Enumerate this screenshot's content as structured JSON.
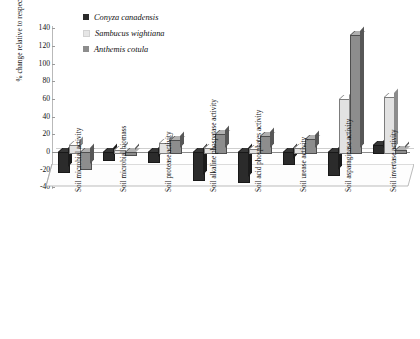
{
  "chart_data": {
    "type": "bar",
    "title": "",
    "xlabel": "",
    "ylabel": "% change relative to respective controls",
    "ylim": [
      -40,
      140
    ],
    "yticks": [
      140,
      120,
      100,
      80,
      60,
      40,
      20,
      0,
      -20,
      -40
    ],
    "grid": false,
    "legend_position": "top-left",
    "categories": [
      "Soil microbial activity",
      "Soil microbial biomass",
      "Soil protease activity",
      "Soil alkaline phospatase activity",
      "Soil acid phosphates activity",
      "Soil urease activity",
      "Soil asparaginase activity",
      "Soil invertase activity"
    ],
    "series": [
      {
        "name": "Conyza canadensis",
        "color": "#2b2b2b",
        "values": [
          -22,
          -8,
          -10,
          -30,
          -33,
          -12,
          -25,
          8
        ]
      },
      {
        "name": "Sambucus wightiana",
        "color": "#e2e2e2",
        "values": [
          8,
          2,
          10,
          5,
          3,
          4,
          60,
          62
        ]
      },
      {
        "name": "Anthemis cotula",
        "color": "#8d8d8d",
        "values": [
          -18,
          -2,
          14,
          20,
          18,
          15,
          132,
          2
        ]
      }
    ]
  },
  "legend": {
    "items": [
      {
        "label": "Conyza canadensis",
        "swatch": "#2b2b2b",
        "icon": "square-swatch-icon"
      },
      {
        "label": "Sambucus wightiana",
        "swatch": "#e2e2e2",
        "icon": "square-swatch-icon"
      },
      {
        "label": "Anthemis cotula",
        "swatch": "#8d8d8d",
        "icon": "square-swatch-icon"
      }
    ]
  }
}
